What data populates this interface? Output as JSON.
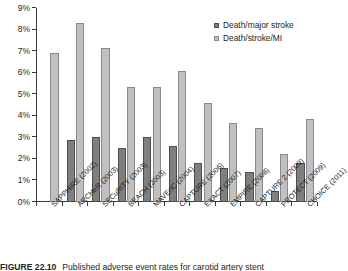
{
  "chart_data": {
    "type": "bar",
    "title": "",
    "xlabel": "",
    "ylabel": "",
    "ylim": [
      0,
      9
    ],
    "ytick_labels": [
      "0%",
      "1%",
      "2%",
      "3%",
      "4%",
      "5%",
      "6%",
      "7%",
      "8%",
      "9%"
    ],
    "ytick_values": [
      0,
      1,
      2,
      3,
      4,
      5,
      6,
      7,
      8,
      9
    ],
    "grid": false,
    "legend_position": "top-right",
    "categories": [
      "SAPPHIRE (2002)",
      "ARCHeR (2003)",
      "SECuRITY (2003)",
      "BEACH (2003)",
      "MAVErIC (2004)",
      "CAPTURE (2006)",
      "EXACT (2007)",
      "EMPIRE (2008)",
      "CAPTURE 2 (2009)",
      "PROTECT (2009)",
      "CHOICE (2011)"
    ],
    "series": [
      {
        "name": "Death/major stroke",
        "color": "#7f7f7f",
        "values": [
          null,
          2.9,
          3.0,
          2.5,
          3.0,
          2.6,
          1.8,
          1.6,
          1.4,
          0.5,
          1.8
        ]
      },
      {
        "name": "Death/stroke/MI",
        "color": "#c0c0c0",
        "values": [
          6.9,
          8.3,
          7.15,
          5.35,
          5.35,
          6.1,
          4.6,
          3.65,
          3.45,
          2.25,
          3.85
        ]
      }
    ]
  },
  "legend": {
    "items": [
      {
        "label": "Death/major stroke",
        "swatch": "dark"
      },
      {
        "label": "Death/stroke/MI",
        "swatch": "light"
      }
    ]
  },
  "caption": {
    "label": "FIGURE 22.10",
    "text": "Published adverse event rates for carotid artery stent"
  }
}
